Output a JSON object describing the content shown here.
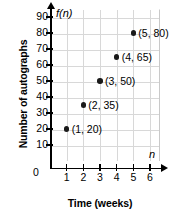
{
  "chart_data": {
    "type": "scatter",
    "title": "",
    "xlabel": "Time (weeks)",
    "ylabel": "Number of autographs",
    "x_variable": "n",
    "y_variable": "f(n)",
    "origin_label": "0",
    "xlim": [
      0,
      6.6
    ],
    "ylim": [
      0,
      95
    ],
    "grid": true,
    "legend": "none",
    "x_ticks": [
      1,
      2,
      3,
      4,
      5,
      6
    ],
    "y_ticks": [
      10,
      20,
      30,
      40,
      50,
      60,
      70,
      80,
      90
    ],
    "x": [
      1,
      2,
      3,
      4,
      5
    ],
    "values": [
      20,
      35,
      50,
      65,
      80
    ],
    "points": [
      {
        "x": 1,
        "y": 20,
        "label": "(1, 20)"
      },
      {
        "x": 2,
        "y": 35,
        "label": "(2, 35)"
      },
      {
        "x": 3,
        "y": 50,
        "label": "(3, 50)"
      },
      {
        "x": 4,
        "y": 65,
        "label": "(4, 65)"
      },
      {
        "x": 5,
        "y": 80,
        "label": "(5, 80)"
      }
    ],
    "colors": {
      "point": "#1a1a1a",
      "axis": "#000000",
      "grid": "#d8d8d8",
      "background": "#ffffff"
    }
  }
}
